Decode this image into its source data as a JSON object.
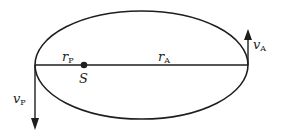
{
  "diagram": {
    "type": "elliptical-orbit",
    "colors": {
      "stroke": "#1e1e1e",
      "background": "#ffffff"
    },
    "ellipse": {
      "cx": 141.5,
      "cy": 65,
      "rx": 106.5,
      "ry": 54
    },
    "focus": {
      "label": "S",
      "x": 84,
      "y": 65
    },
    "labels": {
      "r_perihelion": {
        "main": "r",
        "sub": "P"
      },
      "r_aphelion": {
        "main": "r",
        "sub": "A"
      },
      "v_perihelion": {
        "main": "v",
        "sub": "P"
      },
      "v_aphelion": {
        "main": "v",
        "sub": "A"
      },
      "sun": "S"
    },
    "arrows": {
      "v_aphelion": {
        "x": 248,
        "y_from": 65,
        "y_to": 29,
        "direction": "up"
      },
      "v_perihelion": {
        "x": 35,
        "y_from": 65,
        "y_to": 130,
        "direction": "down"
      }
    }
  }
}
